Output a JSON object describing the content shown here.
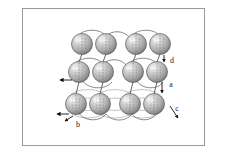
{
  "figure": {
    "background_color": "#ffffff",
    "border_color": "#9a9a9a",
    "border": {
      "x": 22,
      "y": 8,
      "width": 183,
      "height": 138
    }
  },
  "style": {
    "sphere_highlight_color": "#f0f0f0",
    "sphere_mid_color": "#bdbdbd",
    "sphere_shadow_color": "#6e6e6e",
    "sphere_outline_color": "#5a5a5a",
    "bond_arc_color": "#6b6b6b",
    "orbit_ellipse_color": "#9e9e9e",
    "connector_color": "#4a4a4a",
    "dash_line_color": "#707070",
    "arrow_color": "#111111",
    "label_color": "#1a1a1a"
  },
  "lattice": {
    "rows": 3,
    "columns": 4,
    "sphere_radius": 10.5,
    "row_y": [
      44,
      72,
      104
    ],
    "column_x": [
      82,
      106,
      136,
      160
    ],
    "row_offsets_x": [
      0,
      -3,
      -6
    ],
    "spheres": [
      {
        "id": "s-r1-c1",
        "row": 1,
        "col": 1,
        "cx": 82,
        "cy": 44
      },
      {
        "id": "s-r1-c2",
        "row": 1,
        "col": 2,
        "cx": 106,
        "cy": 44
      },
      {
        "id": "s-r1-c3",
        "row": 1,
        "col": 3,
        "cx": 136,
        "cy": 44
      },
      {
        "id": "s-r1-c4",
        "row": 1,
        "col": 4,
        "cx": 160,
        "cy": 44
      },
      {
        "id": "s-r2-c1",
        "row": 2,
        "col": 1,
        "cx": 79,
        "cy": 72
      },
      {
        "id": "s-r2-c2",
        "row": 2,
        "col": 2,
        "cx": 103,
        "cy": 72
      },
      {
        "id": "s-r2-c3",
        "row": 2,
        "col": 3,
        "cx": 133,
        "cy": 72
      },
      {
        "id": "s-r2-c4",
        "row": 2,
        "col": 4,
        "cx": 157,
        "cy": 72
      },
      {
        "id": "s-r3-c1",
        "row": 3,
        "col": 1,
        "cx": 76,
        "cy": 104
      },
      {
        "id": "s-r3-c2",
        "row": 3,
        "col": 2,
        "cx": 100,
        "cy": 104
      },
      {
        "id": "s-r3-c3",
        "row": 3,
        "col": 3,
        "cx": 130,
        "cy": 104
      },
      {
        "id": "s-r3-c4",
        "row": 3,
        "col": 4,
        "cx": 154,
        "cy": 104
      }
    ]
  },
  "labels": [
    {
      "id": "label-d",
      "text": "d",
      "meaning": "vertical inter-layer spacing, upper right",
      "text_x": 172,
      "text_y": 63,
      "arrow_x1": 164,
      "arrow_y1": 55,
      "arrow_y2": 62
    },
    {
      "id": "label-a",
      "text": "a",
      "meaning": "vertical lattice constant, middle right",
      "text_x": 171,
      "text_y": 87,
      "arrow_x1": 162,
      "arrow_y1": 82,
      "arrow_y2": 93
    },
    {
      "id": "label-c",
      "text": "c",
      "meaning": "diagonal depth axis, lower right",
      "text_x": 177,
      "text_y": 111,
      "arrow_x1": 170,
      "arrow_y1": 106,
      "arrow_x2": 178,
      "arrow_y2": 118
    },
    {
      "id": "label-b",
      "text": "b",
      "meaning": "horizontal in-plane axis, lower left",
      "text_x": 78,
      "text_y": 127,
      "arrow_x1": 73,
      "arrow_y1": 116,
      "arrow_x2": 65,
      "arrow_y2": 121
    }
  ],
  "axis_arrows": [
    {
      "id": "arrow-left-middle",
      "x1": 72,
      "y1": 80,
      "x2": 60,
      "y2": 80,
      "direction": "left"
    },
    {
      "id": "arrow-left-bottom",
      "x1": 69,
      "y1": 114,
      "x2": 57,
      "y2": 114,
      "direction": "left"
    }
  ]
}
